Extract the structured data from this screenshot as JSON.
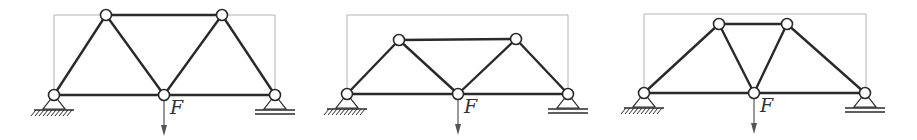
{
  "figure": {
    "colors": {
      "member": "#2a2a2a",
      "bounding_box": "#b4b4b4",
      "node_fill": "#ffffff",
      "load_arrow": "#555555"
    },
    "load_label": "F",
    "trusses": [
      {
        "id": "truss-1",
        "bounding_box": {
          "x1": 54,
          "y1": 15,
          "x2": 275,
          "y2": 95
        },
        "nodes": [
          {
            "name": "left-support",
            "x": 54,
            "y": 95
          },
          {
            "name": "top-left",
            "x": 106,
            "y": 15
          },
          {
            "name": "top-right",
            "x": 222,
            "y": 15
          },
          {
            "name": "bottom-center",
            "x": 164,
            "y": 95
          },
          {
            "name": "right-support",
            "x": 275,
            "y": 95
          }
        ],
        "members": [
          [
            0,
            1
          ],
          [
            1,
            2
          ],
          [
            0,
            3
          ],
          [
            3,
            4
          ],
          [
            1,
            3
          ],
          [
            3,
            2
          ],
          [
            2,
            4
          ]
        ],
        "pin_support": {
          "x": 54,
          "y": 95
        },
        "roller_support": {
          "x": 275,
          "y": 95
        },
        "load": {
          "x": 164,
          "y": 95,
          "label": "F"
        }
      },
      {
        "id": "truss-2",
        "bounding_box": {
          "x1": 347,
          "y1": 15,
          "x2": 568,
          "y2": 94
        },
        "nodes": [
          {
            "name": "left-support",
            "x": 347,
            "y": 94
          },
          {
            "name": "top-left",
            "x": 399,
            "y": 40
          },
          {
            "name": "top-right",
            "x": 516,
            "y": 39
          },
          {
            "name": "bottom-center",
            "x": 458,
            "y": 94
          },
          {
            "name": "right-support",
            "x": 568,
            "y": 94
          }
        ],
        "members": [
          [
            0,
            1
          ],
          [
            1,
            2
          ],
          [
            0,
            3
          ],
          [
            3,
            4
          ],
          [
            1,
            3
          ],
          [
            3,
            2
          ],
          [
            2,
            4
          ]
        ],
        "pin_support": {
          "x": 347,
          "y": 94
        },
        "roller_support": {
          "x": 568,
          "y": 94
        },
        "load": {
          "x": 458,
          "y": 94,
          "label": "F"
        }
      },
      {
        "id": "truss-3",
        "bounding_box": {
          "x1": 644,
          "y1": 14,
          "x2": 866,
          "y2": 93
        },
        "nodes": [
          {
            "name": "left-support",
            "x": 644,
            "y": 93
          },
          {
            "name": "top-left",
            "x": 719,
            "y": 24
          },
          {
            "name": "top-right",
            "x": 787,
            "y": 24
          },
          {
            "name": "bottom-center",
            "x": 754,
            "y": 93
          },
          {
            "name": "right-support",
            "x": 865,
            "y": 93
          }
        ],
        "members": [
          [
            0,
            1
          ],
          [
            1,
            2
          ],
          [
            0,
            3
          ],
          [
            3,
            4
          ],
          [
            1,
            3
          ],
          [
            3,
            2
          ],
          [
            2,
            4
          ]
        ],
        "pin_support": {
          "x": 644,
          "y": 93
        },
        "roller_support": {
          "x": 865,
          "y": 93
        },
        "load": {
          "x": 754,
          "y": 93,
          "label": "F"
        }
      }
    ]
  }
}
